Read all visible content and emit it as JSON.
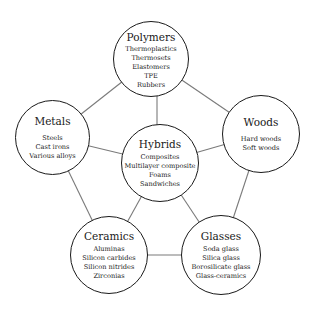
{
  "diagram": {
    "type": "material-families-network",
    "colors": {
      "stroke": "#1a1a1a",
      "edge": "#7a7a7a",
      "fill": "#ffffff"
    },
    "nodes": {
      "polymers": {
        "title": "Polymers",
        "items": [
          "Thermoplastics",
          "Thermosets",
          "Elastomers",
          "TPE",
          "Rubbers"
        ],
        "center": [
          151,
          59
        ]
      },
      "metals": {
        "title": "Metals",
        "items": [
          "Steels",
          "Cast irons",
          "Various alloys"
        ],
        "center": [
          52,
          137
        ]
      },
      "woods": {
        "title": "Woods",
        "items": [
          "Hard woods",
          "Soft woods"
        ],
        "center": [
          261,
          134
        ]
      },
      "hybrids": {
        "title": "Hybrids",
        "items": [
          "Composites",
          "Multilayer composite",
          "Foams",
          "Sandwiches"
        ],
        "center": [
          160,
          163
        ]
      },
      "ceramics": {
        "title": "Ceramics",
        "items": [
          "Aluminas",
          "Silicon carbides",
          "Silicon nitrides",
          "Zirconias"
        ],
        "center": [
          109,
          255
        ]
      },
      "glasses": {
        "title": "Glasses",
        "items": [
          "Soda glass",
          "Silica glass",
          "Borosilicate glass",
          "Glass-ceramics"
        ],
        "center": [
          221,
          255
        ]
      }
    },
    "edges": [
      [
        "polymers",
        "metals"
      ],
      [
        "polymers",
        "woods"
      ],
      [
        "metals",
        "ceramics"
      ],
      [
        "woods",
        "glasses"
      ],
      [
        "ceramics",
        "glasses"
      ],
      [
        "hybrids",
        "polymers"
      ],
      [
        "hybrids",
        "metals"
      ],
      [
        "hybrids",
        "woods"
      ],
      [
        "hybrids",
        "ceramics"
      ],
      [
        "hybrids",
        "glasses"
      ]
    ]
  }
}
